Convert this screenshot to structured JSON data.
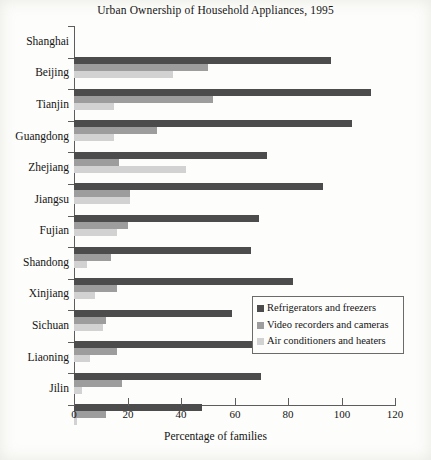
{
  "chart_data": {
    "type": "bar",
    "orientation": "horizontal",
    "title": "Urban Ownership of Household Appliances, 1995",
    "xlabel": "Percentage of families",
    "ylabel": "",
    "xlim": [
      0,
      120
    ],
    "xticks": [
      0,
      20,
      40,
      60,
      80,
      100,
      120
    ],
    "grid": false,
    "legend_position": "inside-bottom-right",
    "categories": [
      "Shanghai",
      "Beijing",
      "Tianjin",
      "Guangdong",
      "Zhejiang",
      "Jiangsu",
      "Fujian",
      "Shandong",
      "Xinjiang",
      "Sichuan",
      "Liaoning",
      "Jilin"
    ],
    "series": [
      {
        "name": "Refrigerators and freezers",
        "color": "#4c4c4c",
        "values": [
          96,
          111,
          104,
          72,
          93,
          69,
          66,
          82,
          59,
          73,
          70,
          48
        ]
      },
      {
        "name": "Video recorders and cameras",
        "color": "#9d9d9d",
        "values": [
          50,
          52,
          31,
          17,
          21,
          20,
          14,
          16,
          12,
          16,
          18,
          12
        ]
      },
      {
        "name": "Air conditioners and heaters",
        "color": "#d2d2d2",
        "values": [
          37,
          15,
          15,
          42,
          21,
          16,
          5,
          8,
          11,
          6,
          3,
          1
        ]
      }
    ]
  },
  "legend": {
    "entries": [
      "Refrigerators and freezers",
      "Video recorders and cameras",
      "Air conditioners and heaters"
    ]
  },
  "colors": {
    "series_1": "#4c4c4c",
    "series_2": "#9d9d9d",
    "series_3": "#d2d2d2",
    "axis": "#5d5d5d",
    "text": "#141414",
    "background": "#fdfdfb"
  }
}
